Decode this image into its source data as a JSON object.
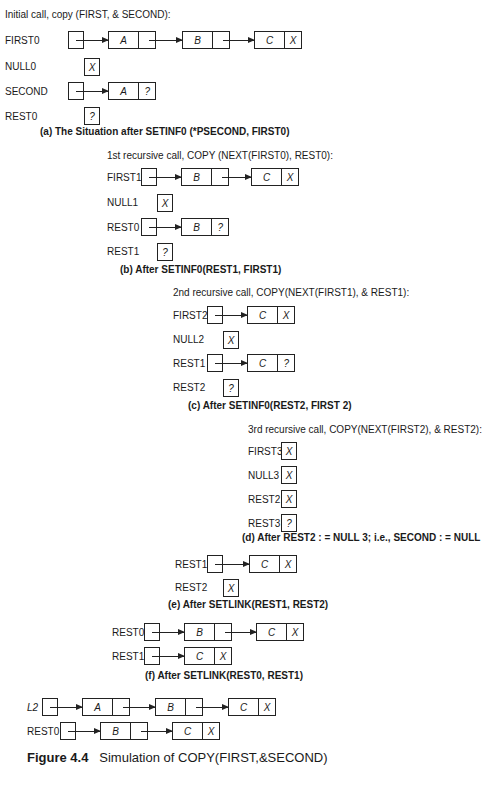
{
  "panels": {
    "a": {
      "title": "Initial call, copy (FIRST, & SECOND):",
      "rows": [
        {
          "label": "FIRST0",
          "nodes": [
            "A",
            "B",
            "C"
          ],
          "last_link": "X"
        },
        {
          "label": "NULL0",
          "cell": "X"
        },
        {
          "label": "SECOND",
          "nodes": [
            "A"
          ],
          "last_link": "?"
        },
        {
          "label": "REST0",
          "cell": "?"
        }
      ],
      "caption": "(a) The Situation after SETINF0 (*PSECOND, FIRST0)"
    },
    "b": {
      "title": "1st recursive call, COPY (NEXT(FIRST0), REST0):",
      "rows": [
        {
          "label": "FIRST1",
          "nodes": [
            "B",
            "C"
          ],
          "last_link": "X"
        },
        {
          "label": "NULL1",
          "cell": "X"
        },
        {
          "label": "REST0",
          "nodes": [
            "B"
          ],
          "last_link": "?"
        },
        {
          "label": "REST1",
          "cell": "?"
        }
      ],
      "caption": "(b) After SETINF0(REST1, FIRST1)"
    },
    "c": {
      "title": "2nd recursive call, COPY(NEXT(FIRST1), & REST1):",
      "rows": [
        {
          "label": "FIRST2",
          "nodes": [
            "C"
          ],
          "last_link": "X"
        },
        {
          "label": "NULL2",
          "cell": "X"
        },
        {
          "label": "REST1",
          "nodes": [
            "C"
          ],
          "last_link": "?"
        },
        {
          "label": "REST2",
          "cell": "?"
        }
      ],
      "caption": "(c) After SETINF0(REST2, FIRST 2)"
    },
    "d": {
      "title": "3rd recursive call, COPY(NEXT(FIRST2), & REST2):",
      "rows": [
        {
          "label": "FIRST3",
          "cell": "X"
        },
        {
          "label": "NULL3",
          "cell": "X"
        },
        {
          "label": "REST2",
          "cell": "X"
        },
        {
          "label": "REST3",
          "cell": "?"
        }
      ],
      "caption": "(d) After REST2 : = NULL 3; i.e., SECOND : = NULL"
    },
    "e": {
      "rows": [
        {
          "label": "REST1",
          "nodes": [
            "C"
          ],
          "last_link": "X"
        },
        {
          "label": "REST2",
          "cell": "X"
        }
      ],
      "caption": "(e) After SETLINK(REST1, REST2)"
    },
    "f": {
      "rows": [
        {
          "label": "REST0",
          "nodes": [
            "B",
            "C"
          ],
          "last_link": "X"
        },
        {
          "label": "REST1",
          "nodes": [
            "C"
          ],
          "last_link": "X"
        }
      ],
      "caption": "(f) After SETLINK(REST0, REST1)"
    },
    "g": {
      "rows": [
        {
          "label": "L2",
          "nodes": [
            "A",
            "B",
            "C"
          ],
          "last_link": "X"
        },
        {
          "label": "REST0",
          "nodes": [
            "B",
            "C"
          ],
          "last_link": "X"
        }
      ]
    }
  },
  "figure": {
    "number": "Figure 4.4",
    "caption": "Simulation of COPY(FIRST,&SECOND)"
  }
}
